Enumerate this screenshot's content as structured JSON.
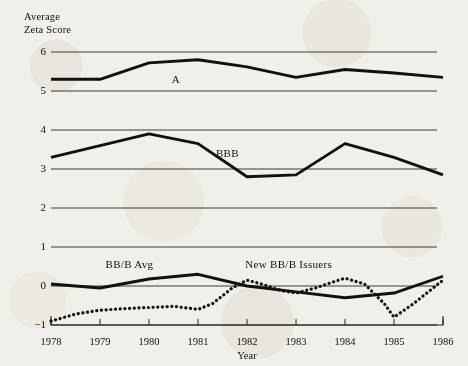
{
  "chart_data": {
    "type": "line",
    "title": "",
    "ylabel": "Average\nZeta Score",
    "xlabel": "Year",
    "x": [
      1978,
      1979,
      1980,
      1981,
      1982,
      1983,
      1984,
      1985,
      1986
    ],
    "categories": [
      "1978",
      "1979",
      "1980",
      "1981",
      "1982",
      "1983",
      "1984",
      "1985",
      "1986"
    ],
    "ylim": [
      -1,
      6
    ],
    "xlim": [
      1978,
      1986
    ],
    "yticks": [
      -1,
      0,
      1,
      2,
      3,
      4,
      5,
      6
    ],
    "ytick_labels": [
      "−1",
      "0",
      "1",
      "2",
      "3",
      "4",
      "5",
      "6"
    ],
    "grid": true,
    "legend_position": "inline-annotations",
    "series": [
      {
        "name": "A",
        "style": "solid",
        "color": "#111111",
        "label_x": 1980.55,
        "label_y": 5.28,
        "values": [
          5.3,
          5.3,
          5.72,
          5.8,
          5.62,
          5.35,
          5.55,
          5.46,
          5.35
        ]
      },
      {
        "name": "BBB",
        "style": "solid",
        "color": "#111111",
        "label_x": 1981.6,
        "label_y": 3.38,
        "values": [
          3.3,
          3.6,
          3.9,
          3.65,
          2.8,
          2.85,
          3.65,
          3.3,
          2.85
        ]
      },
      {
        "name": "BB/B Avg",
        "style": "solid",
        "color": "#111111",
        "label_x": 1979.6,
        "label_y": 0.52,
        "values": [
          0.05,
          -0.05,
          0.18,
          0.3,
          0.0,
          -0.15,
          -0.3,
          -0.18,
          0.25
        ]
      },
      {
        "name": "New BB/B Issuers",
        "style": "dotted",
        "color": "#111111",
        "label_x": 1982.85,
        "label_y": 0.52,
        "dense_x": [
          1978,
          1978.5,
          1979,
          1979.5,
          1980,
          1980.5,
          1981,
          1981.3,
          1981.7,
          1982,
          1982.3,
          1982.7,
          1983,
          1983.4,
          1983.8,
          1984,
          1984.4,
          1984.8,
          1985,
          1985.4,
          1986
        ],
        "dense_values": [
          -0.9,
          -0.72,
          -0.62,
          -0.58,
          -0.55,
          -0.52,
          -0.6,
          -0.45,
          -0.05,
          0.15,
          0.05,
          -0.12,
          -0.18,
          -0.05,
          0.12,
          0.2,
          0.05,
          -0.45,
          -0.8,
          -0.45,
          0.15
        ]
      }
    ],
    "annotations": [
      {
        "text": "A",
        "x": 1980.55,
        "y": 5.28
      },
      {
        "text": "BBB",
        "x": 1981.6,
        "y": 3.38
      },
      {
        "text": "BB/B Avg",
        "x": 1979.6,
        "y": 0.52
      },
      {
        "text": "New BB/B Issuers",
        "x": 1982.85,
        "y": 0.52
      }
    ]
  }
}
